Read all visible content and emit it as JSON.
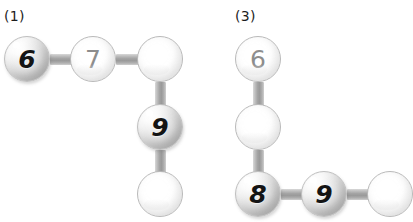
{
  "canvas": {
    "width": 406,
    "height": 218,
    "background": "#ffffff"
  },
  "palette": {
    "rod": "#a3a3a3",
    "ball_outline": "#b9b9b9",
    "shaded_digit": "#141414",
    "flat_digit": "#8d8d8d",
    "label_text": "#1d1d1d"
  },
  "groups": [
    {
      "label": "(1)",
      "label_pos": {
        "x": 4,
        "y": 8
      },
      "nodes": [
        {
          "name": "node-1-a",
          "value": "6",
          "style": "shaded",
          "x": 27,
          "y": 59
        },
        {
          "name": "node-1-b",
          "value": "7",
          "style": "flat",
          "x": 93,
          "y": 59
        },
        {
          "name": "node-1-c",
          "value": "",
          "style": "flat",
          "x": 160,
          "y": 59
        },
        {
          "name": "node-1-d",
          "value": "9",
          "style": "shaded",
          "x": 160,
          "y": 127
        },
        {
          "name": "node-1-e",
          "value": "",
          "style": "flat",
          "x": 160,
          "y": 194
        }
      ],
      "rods": [
        {
          "name": "rod-1-ab",
          "orientation": "h",
          "x": 50,
          "y": 54,
          "length": 43
        },
        {
          "name": "rod-1-bc",
          "orientation": "h",
          "x": 116,
          "y": 54,
          "length": 44
        },
        {
          "name": "rod-1-cd",
          "orientation": "v",
          "x": 155,
          "y": 82,
          "length": 45
        },
        {
          "name": "rod-1-de",
          "orientation": "v",
          "x": 155,
          "y": 150,
          "length": 44
        }
      ]
    },
    {
      "label": "(3)",
      "label_pos": {
        "x": 235,
        "y": 8
      },
      "nodes": [
        {
          "name": "node-3-a",
          "value": "6",
          "style": "flat",
          "x": 258,
          "y": 59
        },
        {
          "name": "node-3-b",
          "value": "",
          "style": "flat",
          "x": 258,
          "y": 127
        },
        {
          "name": "node-3-c",
          "value": "8",
          "style": "shaded",
          "x": 258,
          "y": 194
        },
        {
          "name": "node-3-d",
          "value": "9",
          "style": "shaded",
          "x": 324,
          "y": 194
        },
        {
          "name": "node-3-e",
          "value": "",
          "style": "flat",
          "x": 390,
          "y": 194
        }
      ],
      "rods": [
        {
          "name": "rod-3-ab",
          "orientation": "v",
          "x": 253,
          "y": 82,
          "length": 45
        },
        {
          "name": "rod-3-bc",
          "orientation": "v",
          "x": 253,
          "y": 150,
          "length": 44
        },
        {
          "name": "rod-3-cd",
          "orientation": "h",
          "x": 281,
          "y": 189,
          "length": 43
        },
        {
          "name": "rod-3-de",
          "orientation": "h",
          "x": 347,
          "y": 189,
          "length": 43
        }
      ]
    }
  ]
}
